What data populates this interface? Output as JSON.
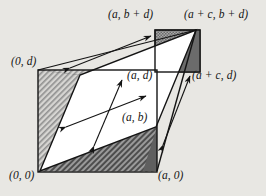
{
  "figure": {
    "background_color": "#e8e7e3",
    "ink_color": "#141414",
    "labels": [
      {
        "id": "a_bplusd",
        "text": "(a, b + d)",
        "x": 108,
        "y": 12
      },
      {
        "id": "aplusc_bplusd",
        "text": "(a + c, b + d)",
        "x": 186,
        "y": 12
      },
      {
        "id": "zero_d",
        "text": "(0, d)",
        "x": 12,
        "y": 60
      },
      {
        "id": "a_d",
        "text": "(a, d)",
        "x": 128,
        "y": 73
      },
      {
        "id": "aplusc_d",
        "text": "(a + c, d)",
        "x": 192,
        "y": 73
      },
      {
        "id": "a_b",
        "text": "(a, b)",
        "x": 122,
        "y": 115
      },
      {
        "id": "zero_zero",
        "text": "(0, 0)",
        "x": 10,
        "y": 173
      },
      {
        "id": "a_zero",
        "text": "(a, 0)",
        "x": 158,
        "y": 173
      }
    ],
    "shapes": {
      "lower_square": {
        "name": "lower-left-square",
        "x": 38,
        "y": 70,
        "w": 119,
        "h": 102,
        "fill": "#9d9d9d"
      },
      "upper_square": {
        "name": "upper-right-square",
        "x": 155,
        "y": 30,
        "w": 45,
        "h": 42,
        "fill": "#8a8a8a"
      },
      "parallelogram": {
        "name": "inner-parallelogram",
        "points": "40,171 80,75 196,30 156,127",
        "fill": "#ffffff"
      }
    },
    "arrows": [
      {
        "id": "arrow-top",
        "name": "double-arrow-top",
        "x1": 70,
        "y1": 68,
        "x2": 151,
        "y2": 36
      },
      {
        "id": "arrow-mid",
        "name": "double-arrow-middle",
        "x1": 66,
        "y1": 127,
        "x2": 146,
        "y2": 96
      },
      {
        "id": "arrow-diag",
        "name": "double-arrow-diagonal",
        "x1": 94,
        "y1": 145,
        "x2": 122,
        "y2": 80
      },
      {
        "id": "arrow-right",
        "name": "double-arrow-right",
        "x1": 163,
        "y1": 144,
        "x2": 190,
        "y2": 76
      }
    ],
    "fill_styles": {
      "hatch_light": "#c9c9c9",
      "hatch_dark": "#6f6f6f",
      "checker": "#9a9a9a",
      "white": "#ffffff",
      "line": "#141414"
    }
  }
}
